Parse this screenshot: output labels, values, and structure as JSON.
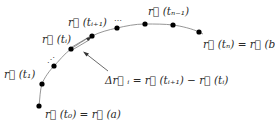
{
  "diagram": {
    "colors": {
      "curve": "#888888",
      "points": "#000000",
      "text": "#2a2a2a",
      "arrow": "#444444"
    },
    "points": [
      {
        "id": "t0",
        "x": 39,
        "y": 106
      },
      {
        "id": "t1",
        "x": 42,
        "y": 84
      },
      {
        "id": "p2",
        "x": 54,
        "y": 66
      },
      {
        "id": "ti",
        "x": 71,
        "y": 49
      },
      {
        "id": "ti1",
        "x": 92,
        "y": 36
      },
      {
        "id": "p5",
        "x": 117,
        "y": 28
      },
      {
        "id": "p6",
        "x": 145,
        "y": 24
      },
      {
        "id": "tn1",
        "x": 173,
        "y": 25
      },
      {
        "id": "tn",
        "x": 199,
        "y": 32
      }
    ],
    "labels": {
      "r_t0": "r⃗ (t₀) = r⃗ (a)",
      "r_t1": "r⃗ (t₁)",
      "r_ti": "r⃗ (tᵢ)",
      "r_ti1": "r⃗ (tᵢ₊₁)",
      "r_tn1": "r⃗ (tₙ₋₁)",
      "r_tn": "r⃗ (tₙ) = r⃗ (b)",
      "delta": "Δr⃗ ᵢ = r⃗ (tᵢ₊₁) − r⃗ (tᵢ)",
      "ellipsis_lower": "⋰",
      "ellipsis_upper": "⋯"
    }
  }
}
